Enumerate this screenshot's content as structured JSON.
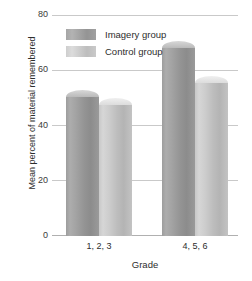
{
  "chart_data": {
    "type": "bar",
    "title": "",
    "xlabel": "Grade",
    "ylabel": "Mean percent of material remembered",
    "categories": [
      "1, 2, 3",
      "4, 5, 6"
    ],
    "series": [
      {
        "name": "Imagery group",
        "values": [
          53,
          71
        ],
        "color": "#9a9a9a"
      },
      {
        "name": "Control group",
        "values": [
          50,
          58
        ],
        "color": "#c6c6c6"
      }
    ],
    "ylim": [
      0,
      80
    ],
    "yticks": [
      80,
      60,
      40,
      20,
      0
    ],
    "ytick_labels": [
      "80",
      "60",
      "40",
      "20",
      "0"
    ],
    "grid": true,
    "legend_position": "top-left-inside"
  },
  "legend": {
    "items": [
      {
        "label": "Imagery group",
        "swatch": "dark"
      },
      {
        "label": "Control group",
        "swatch": "light"
      }
    ]
  },
  "axes": {
    "y_title": "Mean percent of material remembered",
    "x_title": "Grade",
    "y_ticks": [
      "80",
      "60",
      "40",
      "20",
      "0"
    ],
    "x_ticks": [
      "1, 2, 3",
      "4, 5, 6"
    ]
  },
  "colors": {
    "bar_dark": "#9a9a9a",
    "bar_light": "#c6c6c6",
    "gridline": "#c9c9c9",
    "text": "#2d2d2d"
  }
}
